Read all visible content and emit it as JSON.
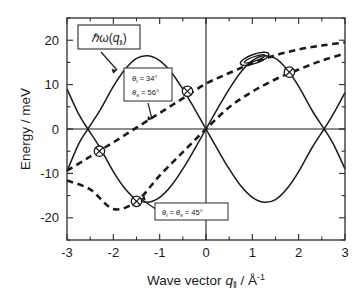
{
  "axes": {
    "x": {
      "title_prefix": "Wave vector",
      "title_symbol": "q",
      "title_symbol_sub": "‖",
      "title_unit": " / Å",
      "title_unit_sup": "-1",
      "min": -3,
      "max": 3,
      "ticks": [
        "-3",
        "-2",
        "-1",
        "0",
        "1",
        "2",
        "3"
      ],
      "tick_values": [
        -3,
        -2,
        -1,
        0,
        1,
        2,
        3
      ],
      "minor_step": 0.5
    },
    "y": {
      "title": "Energy / meV",
      "min": -25,
      "max": 25,
      "ticks": [
        "20",
        "10",
        "0",
        "-10",
        "-20"
      ],
      "tick_values": [
        20,
        10,
        0,
        -10,
        -20
      ],
      "minor_step": 5
    }
  },
  "labels": {
    "dispersion": {
      "hbar": "ℏ",
      "omega": "ω",
      "arg_open": "(",
      "arg_symbol": "q",
      "arg_sub": "‖",
      "arg_close": ")"
    },
    "annotation_upper": {
      "line1_symbol": "θ",
      "line1_sub": "i",
      "line1_value": "= 34°",
      "line2_symbol": "θ",
      "line2_sub": "s",
      "line2_value": "= 56°"
    },
    "annotation_lower": {
      "symbol1": "θ",
      "sub1": "i",
      "eq": "=",
      "symbol2": "θ",
      "sub2": "s",
      "value": "= 45°"
    }
  },
  "colors": {
    "ink": "#1a1a1a",
    "frame": "#2b2b2b",
    "background": "#ffffff"
  },
  "chart_data": {
    "type": "line",
    "title": "",
    "xlabel": "Wave vector q‖ / Å⁻¹",
    "ylabel": "Energy / meV",
    "xlim": [
      -3,
      3
    ],
    "ylim": [
      -25,
      25
    ],
    "grid": false,
    "legend": "none",
    "series": [
      {
        "name": "hbar*omega(q) upper branch",
        "style": "solid",
        "description": "Phonon dispersion, positive branch: 16.5*sin(2*pi*q/5.1) shaped sinusoid",
        "x": [
          -3.0,
          -2.75,
          -2.55,
          -2.3,
          -2.0,
          -1.75,
          -1.5,
          -1.25,
          -1.0,
          -0.75,
          -0.5,
          -0.25,
          0.0,
          0.25,
          0.5,
          0.75,
          1.0,
          1.25,
          1.5,
          1.75,
          2.0,
          2.3,
          2.55,
          2.75,
          3.0
        ],
        "y": [
          9.0,
          3.4,
          0.0,
          -4.0,
          -9.6,
          -13.4,
          -15.9,
          -16.5,
          -15.4,
          -12.8,
          -9.0,
          -4.6,
          0.0,
          4.6,
          9.0,
          12.8,
          15.4,
          16.5,
          15.9,
          13.4,
          9.6,
          4.0,
          0.0,
          -3.4,
          -9.0
        ]
      },
      {
        "name": "hbar*omega(q) lower branch",
        "style": "solid",
        "description": "Phonon dispersion, mirrored branch",
        "x": [
          -3.0,
          -2.75,
          -2.55,
          -2.3,
          -2.0,
          -1.75,
          -1.5,
          -1.25,
          -1.0,
          -0.75,
          -0.5,
          -0.25,
          0.0,
          0.25,
          0.5,
          0.75,
          1.0,
          1.25,
          1.5,
          1.75,
          2.0,
          2.3,
          2.55,
          2.75,
          3.0
        ],
        "y": [
          -9.5,
          -3.4,
          0.0,
          4.0,
          9.6,
          13.4,
          15.9,
          16.5,
          15.4,
          12.8,
          9.0,
          4.6,
          0.0,
          -4.6,
          -9.0,
          -12.8,
          -15.4,
          -16.5,
          -15.9,
          -13.4,
          -9.6,
          -4.0,
          0.0,
          3.4,
          8.2
        ]
      },
      {
        "name": "scan curve theta_i = 34, theta_s = 56",
        "style": "dashed",
        "description": "Kinematic scan curve, upper dashed",
        "x": [
          -3.0,
          -2.5,
          -2.0,
          -1.5,
          -1.0,
          -0.5,
          0.0,
          0.5,
          1.0,
          1.5,
          2.0,
          2.5,
          3.0
        ],
        "y": [
          -9.4,
          -6.2,
          -3.0,
          0.3,
          3.6,
          6.9,
          10.2,
          12.6,
          14.8,
          16.6,
          17.9,
          18.8,
          19.5
        ]
      },
      {
        "name": "scan curve theta_i = theta_s = 45",
        "style": "dashed",
        "description": "Kinematic scan curve, lower dashed",
        "x": [
          -3.0,
          -2.5,
          -2.0,
          -1.5,
          -1.0,
          -0.5,
          0.0,
          0.5,
          1.0,
          1.5,
          2.0,
          2.5,
          3.0
        ],
        "y": [
          -11.6,
          -13.6,
          -18.0,
          -16.3,
          -10.5,
          -5.2,
          0.0,
          4.9,
          8.4,
          11.2,
          13.4,
          15.4,
          17.0
        ]
      }
    ],
    "markers": [
      {
        "shape": "circle-cross",
        "x": -2.3,
        "y": -5.0,
        "label": ""
      },
      {
        "shape": "circle-cross",
        "x": -1.5,
        "y": -16.3,
        "label": ""
      },
      {
        "shape": "circle-cross",
        "x": -0.4,
        "y": 8.5,
        "label": ""
      },
      {
        "shape": "circle-cross",
        "x": 1.8,
        "y": 12.8,
        "label": ""
      },
      {
        "shape": "ellipse-tilted",
        "x": 1.05,
        "y": 15.8,
        "label": ""
      }
    ],
    "annotations": [
      {
        "text": "ℏω(q‖)",
        "x": -2.0,
        "y": 20.5,
        "boxed": true
      },
      {
        "text": "θi = 34° ; θs = 56°",
        "x": -1.1,
        "y": 8.0,
        "boxed": true
      },
      {
        "text": "θi = θs = 45°",
        "x": -0.65,
        "y": -20.5,
        "boxed": true
      }
    ]
  }
}
